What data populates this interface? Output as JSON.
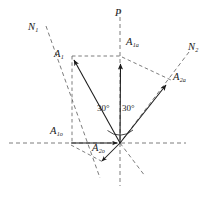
{
  "figure": {
    "background_color": "#ffffff",
    "line_color": "#1a1a1a",
    "dash_color": "#555555",
    "width": 215,
    "height": 206
  },
  "axes": {
    "vertical_label": "P",
    "horizontal_label": ""
  },
  "normals": {
    "n1_label": "N",
    "n1_sub": "1",
    "n2_label": "N",
    "n2_sub": "2"
  },
  "vectors": [
    {
      "name": "A",
      "sub": "1",
      "label_x": 54,
      "label_y": 55,
      "desc": "resultant-vector-a1"
    },
    {
      "name": "A",
      "sub": "1a",
      "label_x": 126,
      "label_y": 43,
      "desc": "component-vector-a1a"
    },
    {
      "name": "A",
      "sub": "1o",
      "label_x": 50,
      "label_y": 130,
      "desc": "component-vector-a1o"
    },
    {
      "name": "A",
      "sub": "2a",
      "label_x": 172,
      "label_y": 78,
      "desc": "component-vector-a2a"
    },
    {
      "name": "A",
      "sub": "2o",
      "label_x": 96,
      "label_y": 147,
      "desc": "component-vector-a2o"
    }
  ],
  "angles": [
    {
      "value": "30°",
      "label_x": 97,
      "label_y": 106
    },
    {
      "value": "30°",
      "label_x": 122,
      "label_y": 106
    }
  ],
  "geometry": {
    "origin_x": 120,
    "origin_y": 143,
    "p_axis_top_y": 10,
    "p_axis_bottom_y": 186,
    "h_axis_left_x": 9,
    "h_axis_right_x": 186,
    "a1_tip_x": 72,
    "a1_tip_y": 58,
    "a1a_tip_x": 121,
    "a1a_tip_y": 62,
    "a1o_tail_x": 71,
    "a2a_tip_x": 168,
    "a2a_tip_y": 83,
    "a2o_tip_x": 100,
    "a2o_tip_y": 163
  }
}
